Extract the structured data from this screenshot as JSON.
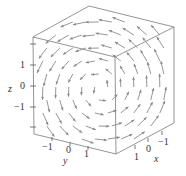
{
  "chart_data": {
    "type": "vector_field_3d",
    "title": "",
    "axes": {
      "x": {
        "label": "x",
        "ticks": [
          "1",
          "0",
          "−1"
        ],
        "range": [
          -2,
          2
        ]
      },
      "y": {
        "label": "y",
        "ticks": [
          "−1",
          "0",
          "1"
        ],
        "range": [
          -2,
          2
        ]
      },
      "z": {
        "label": "z",
        "ticks": [
          "1",
          "0",
          "−1"
        ],
        "range": [
          -2,
          2
        ]
      }
    },
    "grid": false,
    "legend": null,
    "colors": {
      "arrow": "#8a8a8a",
      "box": "#7a7a7a",
      "text": "#333333"
    }
  },
  "labels": {
    "z_axis": "z",
    "y_axis": "y",
    "x_axis": "x",
    "z_ticks": [
      "1",
      "0",
      "−1"
    ],
    "y_ticks": [
      "−1",
      "0",
      "1"
    ],
    "x_ticks": [
      "1",
      "0",
      "−1"
    ]
  }
}
